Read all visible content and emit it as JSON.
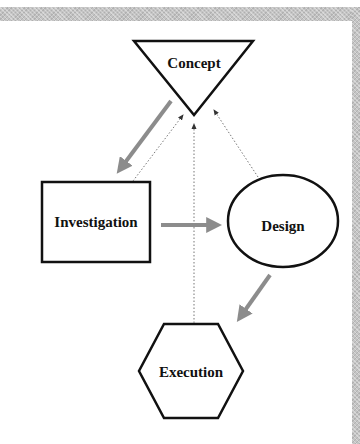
{
  "diagram": {
    "nodes": [
      {
        "id": "concept",
        "label": "Concept",
        "shape": "inverted-triangle"
      },
      {
        "id": "investigation",
        "label": "Investigation",
        "shape": "rectangle"
      },
      {
        "id": "design",
        "label": "Design",
        "shape": "ellipse"
      },
      {
        "id": "execution",
        "label": "Execution",
        "shape": "hexagon"
      }
    ],
    "edges": [
      {
        "from": "concept",
        "to": "investigation",
        "style": "solid-thick-gray"
      },
      {
        "from": "investigation",
        "to": "design",
        "style": "solid-thick-gray"
      },
      {
        "from": "design",
        "to": "execution",
        "style": "solid-thick-gray"
      },
      {
        "from": "investigation",
        "to": "concept",
        "style": "dotted"
      },
      {
        "from": "execution",
        "to": "concept",
        "style": "dotted"
      },
      {
        "from": "design",
        "to": "concept",
        "style": "dotted"
      }
    ],
    "colors": {
      "outline": "#111111",
      "main_arrow": "#8c8c8c",
      "dotted_arrow": "#777777",
      "frame": "#c4c4c4"
    }
  }
}
